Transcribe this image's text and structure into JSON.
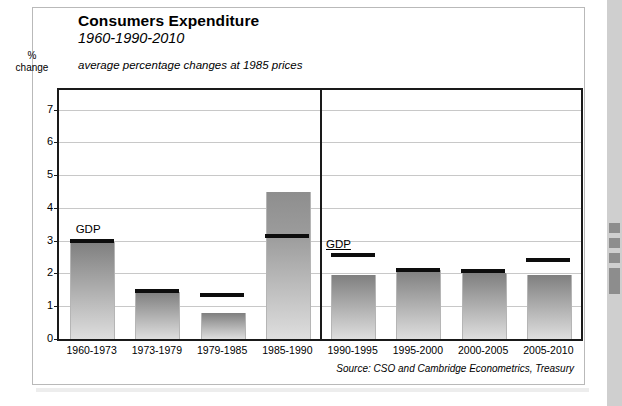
{
  "frame": {
    "right_strip_color": "#cfcfcf"
  },
  "header": {
    "title": "Consumers Expenditure",
    "subtitle": "1960-1990-2010",
    "caption": "average percentage changes at 1985 prices",
    "y_axis_caption_line1": "%",
    "y_axis_caption_line2": "change"
  },
  "footer": {
    "source": "Source: CSO and Cambridge Econometrics, Treasury"
  },
  "annotations": {
    "gdp_left": "GDP",
    "gdp_right": "GDP"
  },
  "chart_data": {
    "type": "bar",
    "title": "Consumers Expenditure",
    "subtitle": "1960-1990-2010",
    "xlabel": "",
    "ylabel": "% change",
    "ylim": [
      0,
      7.6
    ],
    "yticks": [
      0,
      1,
      2,
      3,
      4,
      5,
      6,
      7
    ],
    "ytick_labels": [
      "0",
      "1",
      "2",
      "3",
      "4",
      "5",
      "6",
      "7"
    ],
    "grid": true,
    "legend": "none",
    "categories": [
      "1960-1973",
      "1973-1979",
      "1979-1985",
      "1985-1990",
      "1990-1995",
      "1995-2000",
      "2000-2005",
      "2005-2010"
    ],
    "series": [
      {
        "name": "Consumers expenditure",
        "values": [
          2.95,
          1.45,
          0.8,
          4.5,
          1.95,
          2.1,
          2.0,
          1.95
        ]
      },
      {
        "name": "GDP",
        "marker": "line",
        "values": [
          2.98,
          1.48,
          1.35,
          3.15,
          2.55,
          2.12,
          2.08,
          2.4
        ]
      }
    ],
    "panels": [
      {
        "name": "history",
        "categories": [
          "1960-1973",
          "1973-1979",
          "1979-1985",
          "1985-1990"
        ]
      },
      {
        "name": "forecast",
        "categories": [
          "1990-1995",
          "1995-2000",
          "2000-2005",
          "2005-2010"
        ]
      }
    ],
    "panel_divider_after": "1985-1990",
    "bar_highlight": {
      "category": "1985-1990",
      "note": "segment above GDP line shaded darker",
      "from": 3.15,
      "to": 4.5
    }
  }
}
